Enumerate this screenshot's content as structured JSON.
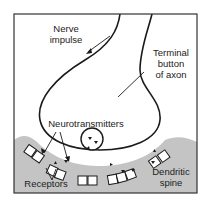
{
  "diagram": {
    "labels": {
      "nerve_impulse": [
        "Nerve",
        "impulse"
      ],
      "terminal_button": [
        "Terminal",
        "button",
        "of axon"
      ],
      "neurotransmitters": "Neurotransmitters",
      "receptors": "Receptors",
      "dendritic_spine": [
        "Dendritic",
        "spine"
      ]
    },
    "colors": {
      "spine_fill": "#c4c4c4",
      "line": "#1a1a1a",
      "frame": "#333333"
    }
  }
}
